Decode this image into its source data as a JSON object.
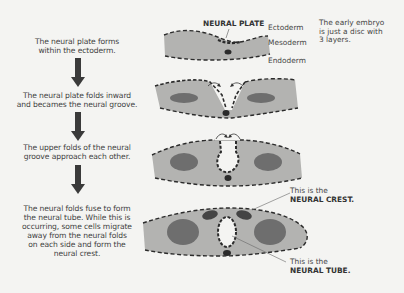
{
  "steps": [
    {
      "text_line1": "The neural plate forms",
      "text_line2": "within the ectoderm."
    },
    {
      "text_line1": "The neural plate folds inward",
      "text_line2": "and becames the neural groove."
    },
    {
      "text_line1": "The upper folds of the neural",
      "text_line2": "groove approach each other."
    },
    {
      "lines": [
        "The neural folds fuse to form",
        "the neural tube. While this is",
        "occurring, some cells migrate",
        "away from the neural folds",
        "on each side and form the",
        "neural crest."
      ]
    }
  ],
  "labels": {
    "neural_plate": "NEURAL PLATE",
    "ectoderm": "Ectoderm",
    "mesoderm": "Mesoderm",
    "endoderm": "Endoderm",
    "embryo_note": [
      "The early embryo",
      "is just a disc with",
      "3 layers."
    ],
    "crest_prefix": "This is the",
    "crest_name": "NEURAL CREST.",
    "tube_prefix": "This is the",
    "tube_name": "NEURAL TUBE."
  },
  "colors": {
    "background": "#f4f4f2",
    "tissue": "#b3b3b1",
    "somite": "#6e6e6e",
    "dash": "#2b2b2b",
    "arrow": "#3a3a3a"
  }
}
